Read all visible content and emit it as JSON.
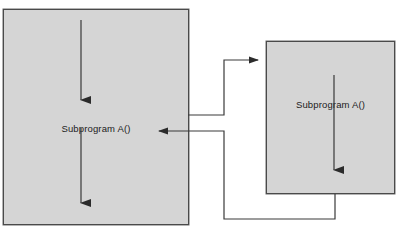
{
  "diagram": {
    "type": "control-flow-diagram",
    "title_visible": false,
    "background_color": "#ffffff",
    "box_fill_color": "#d5d5d5",
    "box_border_color": "#4a4a4a",
    "line_color": "#3a3a3a",
    "boxes": [
      {
        "id": "left",
        "label": "Subprogram A()",
        "x": 3,
        "y": 9,
        "width": 186,
        "height": 216,
        "internal_arrows": [
          {
            "x": 81,
            "y1": 20,
            "y2": 106,
            "direction": "down"
          },
          {
            "x": 81,
            "y1": 128,
            "y2": 209,
            "direction": "down"
          }
        ]
      },
      {
        "id": "right",
        "label": "Subprogram A()",
        "x": 266,
        "y": 41,
        "width": 129,
        "height": 153,
        "internal_arrows": [
          {
            "x": 334,
            "y1": 75,
            "y2": 176,
            "direction": "down"
          }
        ]
      }
    ],
    "connectors": [
      {
        "id": "call",
        "from": "left",
        "to": "right",
        "arrowhead": "end",
        "points": "189,115 224,115 224,60 264,60"
      },
      {
        "id": "return",
        "from": "right",
        "to": "left",
        "arrowhead": "end",
        "points": "335,194 335,219 224,219 224,131 152,131"
      }
    ]
  }
}
